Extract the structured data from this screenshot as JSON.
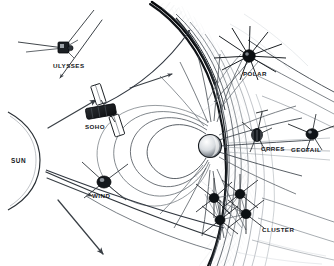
{
  "figure": {
    "background_color": "#ffffff",
    "ink_color": "#1a1d21",
    "faint_color": "#9aa0a6"
  },
  "labels": {
    "sun": "SUN",
    "ulysses": "ULYSSES",
    "soho": "SOHO",
    "wind": "WIND",
    "polar": "POLAR",
    "crres": "CRRES",
    "geotail": "GEOTAIL",
    "cluster": "CLUSTER"
  },
  "objects": [
    {
      "name": "sun",
      "label": "SUN",
      "kind": "star-limb",
      "x": 22,
      "y": 160
    },
    {
      "name": "ulysses",
      "label": "ULYSSES",
      "kind": "spacecraft",
      "x": 64,
      "y": 48
    },
    {
      "name": "soho",
      "label": "SOHO",
      "kind": "spacecraft",
      "x": 101,
      "y": 112
    },
    {
      "name": "wind",
      "label": "WIND",
      "kind": "spacecraft",
      "x": 104,
      "y": 182
    },
    {
      "name": "polar",
      "label": "POLAR",
      "kind": "spacecraft",
      "x": 249,
      "y": 56
    },
    {
      "name": "crres",
      "label": "CRRES",
      "kind": "spacecraft",
      "x": 257,
      "y": 135
    },
    {
      "name": "geotail",
      "label": "GEOTAIL",
      "kind": "spacecraft",
      "x": 312,
      "y": 134
    },
    {
      "name": "cluster",
      "label": "CLUSTER",
      "kind": "spacecraft-constellation",
      "x": 233,
      "y": 212
    },
    {
      "name": "earth",
      "label": "",
      "kind": "planet",
      "x": 210,
      "y": 146
    }
  ],
  "structures": [
    {
      "name": "bow-shock",
      "description": "outer curved shock boundary"
    },
    {
      "name": "magnetopause",
      "description": "inner curved boundary enclosing magnetosphere"
    },
    {
      "name": "magnetosheath",
      "description": "hatched region between bow shock and magnetopause"
    },
    {
      "name": "magnetic-field-lines",
      "description": "dipole field lines radiating from Earth"
    },
    {
      "name": "magnetotail",
      "description": "elongated tail extending to the right"
    },
    {
      "name": "solar-wind-arrows",
      "description": "arrows flowing from Sun toward Earth"
    }
  ]
}
